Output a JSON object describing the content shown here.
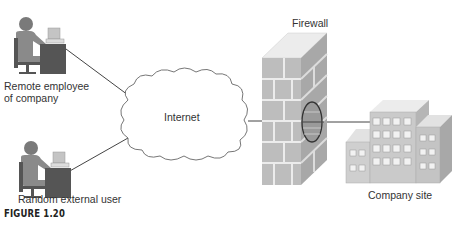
{
  "figure": {
    "caption": "FIGURE 1.20"
  },
  "nodes": {
    "remote_employee": {
      "label_line1": "Remote employee",
      "label_line2": "of company",
      "icon": "person-at-computer-icon"
    },
    "external_user": {
      "label": "Random external user",
      "icon": "person-at-computer-icon"
    },
    "internet": {
      "label": "Internet",
      "icon": "cloud-icon"
    },
    "firewall": {
      "label": "Firewall",
      "icon": "brick-wall-icon"
    },
    "company_site": {
      "label": "Company site",
      "icon": "office-buildings-icon"
    }
  },
  "edges": [
    {
      "from": "remote_employee",
      "to": "internet"
    },
    {
      "from": "external_user",
      "to": "internet"
    },
    {
      "from": "internet",
      "to": "firewall"
    },
    {
      "from": "firewall",
      "to": "company_site",
      "note": "passes through hole in firewall"
    }
  ],
  "colors": {
    "figure_dark": "#5a5a5a",
    "figure_mid": "#8a8a8a",
    "brick": "#b8b8b8",
    "mortar": "#e8e8e8",
    "building": "#c8c8c8",
    "line": "#444444"
  }
}
